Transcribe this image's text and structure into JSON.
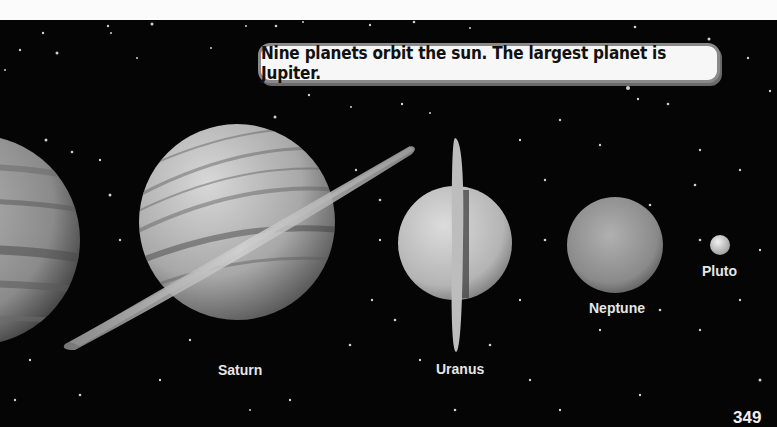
{
  "callout": {
    "text": "Nine planets orbit the sun. The largest planet is Jupiter."
  },
  "planets": [
    {
      "name": "Jupiter",
      "label": ""
    },
    {
      "name": "Saturn",
      "label": "Saturn"
    },
    {
      "name": "Uranus",
      "label": "Uranus"
    },
    {
      "name": "Neptune",
      "label": "Neptune"
    },
    {
      "name": "Pluto",
      "label": "Pluto"
    }
  ],
  "page_number": "349",
  "colors": {
    "space": "#050505",
    "callout_bg": "#f7f7f7",
    "callout_border": "#8a8a8a",
    "label": "#e6e6e6"
  }
}
